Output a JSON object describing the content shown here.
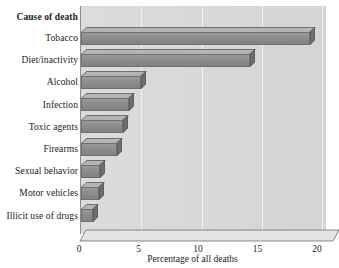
{
  "chart_data": {
    "type": "bar",
    "orientation": "horizontal",
    "title": "",
    "category_header": "Cause of death",
    "categories": [
      "Tobacco",
      "Diet/inactivity",
      "Alcohol",
      "Infection",
      "Toxic agents",
      "Firearms",
      "Sexual behavior",
      "Motor vehicles",
      "Illicit use of drugs"
    ],
    "values": [
      19,
      14,
      5,
      4,
      3.5,
      3,
      1.6,
      1.5,
      1
    ],
    "xlabel": "Percentage of all deaths",
    "ylabel": "Cause of death",
    "xlim": [
      0,
      20
    ],
    "xticks": [
      0,
      5,
      10,
      15,
      20
    ],
    "xtick_labels": [
      "0",
      "5",
      "10",
      "15",
      "20"
    ],
    "grid": true,
    "legend": null,
    "style": "3d-bars",
    "colors": {
      "bar_face": "#8c8c8c",
      "bar_top": "#b4b4b4",
      "bar_side": "#6e6e6e",
      "plot_background": "#d8d8d8",
      "page_background": "#ffffff",
      "text": "#1a1a1a"
    }
  }
}
